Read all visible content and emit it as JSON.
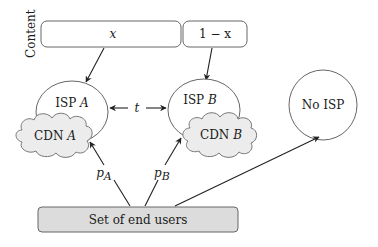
{
  "diagram": {
    "side_label": "Content",
    "content_boxes": [
      {
        "label": "x"
      },
      {
        "label": "1 − x"
      }
    ],
    "nodes": {
      "isp_a": {
        "prefix": "ISP ",
        "var": "A"
      },
      "isp_b": {
        "prefix": "ISP ",
        "var": "B"
      },
      "cdn_a": {
        "prefix": "CDN ",
        "var": "A"
      },
      "cdn_b": {
        "prefix": "CDN ",
        "var": "B"
      },
      "no_isp": {
        "label": "No ISP"
      },
      "end_users": {
        "label": "Set of end users"
      }
    },
    "edges": {
      "isp_link": {
        "label": "t"
      },
      "to_isp_a": {
        "label_base": "p",
        "label_sub": "A"
      },
      "to_isp_b": {
        "label_base": "p",
        "label_sub": "B"
      }
    },
    "colors": {
      "stroke": "#555555",
      "arrow": "#222222",
      "cloud_fill": "#ececec",
      "users_fill": "#dcdcdc",
      "box_fill": "#ffffff"
    }
  }
}
